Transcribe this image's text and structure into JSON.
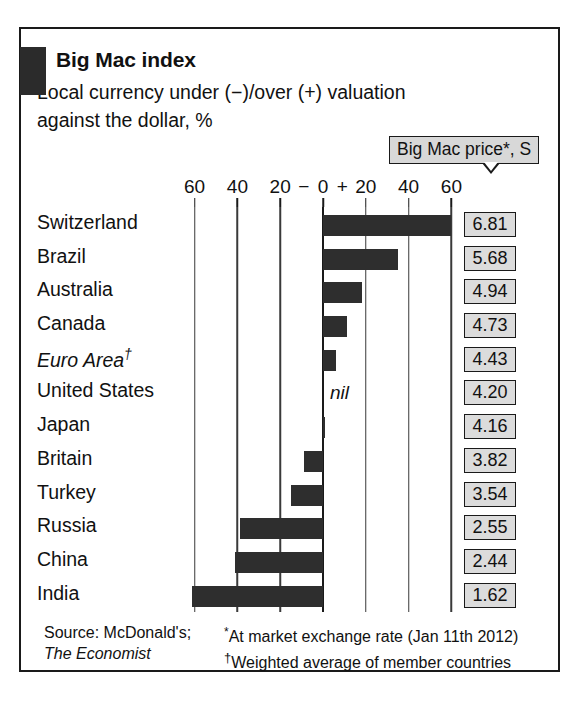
{
  "header": {
    "title": "Big Mac index",
    "subtitle_line1": "Local currency under (−)/over (+) valuation",
    "subtitle_line2": "against the dollar, %"
  },
  "price_callout": {
    "label": "Big Mac price*, S"
  },
  "axis": {
    "tick_labels": [
      "60",
      "40",
      "20",
      "0",
      "20",
      "40",
      "60"
    ],
    "negative_sign": "−",
    "positive_sign": "+"
  },
  "nil_label": "nil",
  "footer": {
    "source_line1": "Source: McDonald's;",
    "source_line2": "The Economist",
    "note_star": "*At market exchange rate (Jan 11th 2012)",
    "note_dagger": "†Weighted average of member countries"
  },
  "chart_data": {
    "type": "bar",
    "orientation": "horizontal",
    "title": "Big Mac index",
    "subtitle": "Local currency under (−)/over (+) valuation against the dollar, %",
    "xlabel": "",
    "ylabel": "",
    "xlim": [
      -60,
      60
    ],
    "xticks": [
      -60,
      -40,
      -20,
      0,
      20,
      40,
      60
    ],
    "grid": true,
    "legend": false,
    "categories": [
      "Switzerland",
      "Brazil",
      "Australia",
      "Canada",
      "Euro Area†",
      "United States",
      "Japan",
      "Britain",
      "Turkey",
      "Russia",
      "China",
      "India"
    ],
    "series": [
      {
        "name": "Local currency valuation vs dollar, %",
        "values": [
          60,
          35,
          18,
          11,
          6,
          0,
          1,
          -9,
          -15,
          -39,
          -41,
          -61
        ]
      }
    ],
    "secondary_series": [
      {
        "name": "Big Mac price*, S",
        "values": [
          6.81,
          5.68,
          4.94,
          4.73,
          4.43,
          4.2,
          4.16,
          3.82,
          3.54,
          2.55,
          2.44,
          1.62
        ]
      }
    ],
    "annotations": [
      {
        "category": "United States",
        "text": "nil"
      }
    ],
    "source": "Source: McDonald's; The Economist",
    "notes": [
      "*At market exchange rate (Jan 11th 2012)",
      "†Weighted average of member countries"
    ]
  },
  "rows": [
    {
      "country": "Switzerland",
      "italic": false,
      "dagger": false,
      "value": 60,
      "price": "6.81",
      "nil": false
    },
    {
      "country": "Brazil",
      "italic": false,
      "dagger": false,
      "value": 35,
      "price": "5.68",
      "nil": false
    },
    {
      "country": "Australia",
      "italic": false,
      "dagger": false,
      "value": 18,
      "price": "4.94",
      "nil": false
    },
    {
      "country": "Canada",
      "italic": false,
      "dagger": false,
      "value": 11,
      "price": "4.73",
      "nil": false
    },
    {
      "country": "Euro Area",
      "italic": true,
      "dagger": true,
      "value": 6,
      "price": "4.43",
      "nil": false
    },
    {
      "country": "United States",
      "italic": false,
      "dagger": false,
      "value": 0,
      "price": "4.20",
      "nil": true
    },
    {
      "country": "Japan",
      "italic": false,
      "dagger": false,
      "value": 1,
      "price": "4.16",
      "nil": false
    },
    {
      "country": "Britain",
      "italic": false,
      "dagger": false,
      "value": -9,
      "price": "3.82",
      "nil": false
    },
    {
      "country": "Turkey",
      "italic": false,
      "dagger": false,
      "value": -15,
      "price": "3.54",
      "nil": false
    },
    {
      "country": "Russia",
      "italic": false,
      "dagger": false,
      "value": -39,
      "price": "2.55",
      "nil": false
    },
    {
      "country": "China",
      "italic": false,
      "dagger": false,
      "value": -41,
      "price": "2.44",
      "nil": false
    },
    {
      "country": "India",
      "italic": false,
      "dagger": false,
      "value": -61,
      "price": "1.62",
      "nil": false
    }
  ]
}
